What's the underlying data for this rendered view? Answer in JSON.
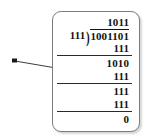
{
  "figure": {
    "kind": "binary-long-division",
    "callout": {
      "marker": "dot-marker",
      "line": "leader-line"
    },
    "problem": {
      "divisor": "111",
      "dividend": "1001101",
      "quotient": "1011",
      "remainder": "0",
      "bracket_glyph": ")"
    },
    "steps": [
      {
        "name": "quotient",
        "value": "1011",
        "ruled": false
      },
      {
        "name": "first-subtract",
        "value": "111",
        "ruled": true
      },
      {
        "name": "first-remainder",
        "value": "1010",
        "ruled": false
      },
      {
        "name": "second-subtract",
        "value": "111",
        "ruled": true
      },
      {
        "name": "second-remainder",
        "value": "111",
        "ruled": false
      },
      {
        "name": "third-subtract",
        "value": "111",
        "ruled": true
      },
      {
        "name": "final-remainder",
        "value": "0",
        "ruled": false
      }
    ]
  },
  "colors": {
    "ink": "#121212",
    "box_border": "#7c7c7c",
    "rule": "#2a2a2a",
    "background": "#ffffff"
  }
}
